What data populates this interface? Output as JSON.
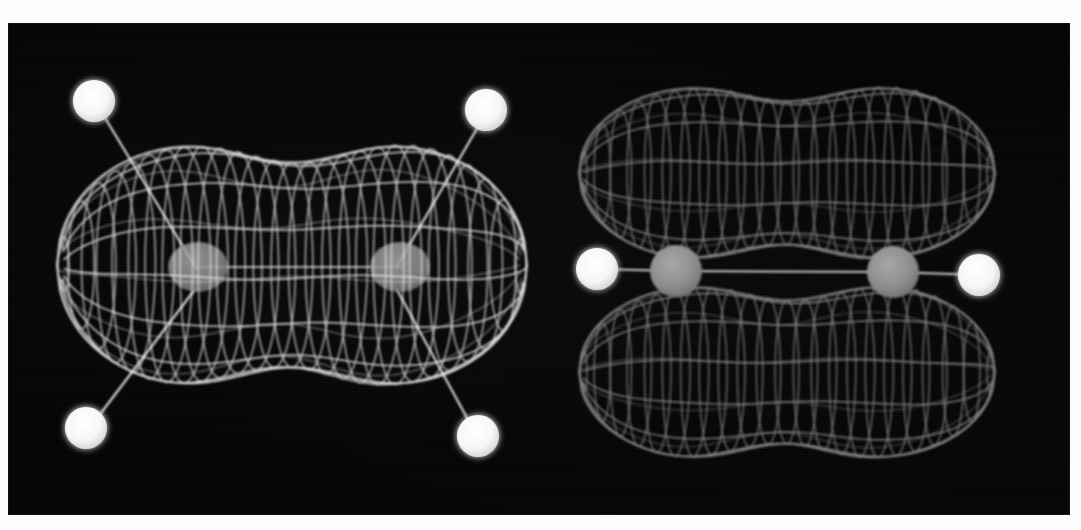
{
  "figure": {
    "background_color": "#fcfcfc",
    "panel_color": "#050505",
    "panel": {
      "x": 8,
      "y": 23,
      "width": 1062,
      "height": 492
    },
    "mesh_color_left": "#f2f2f2",
    "mesh_color_right": "#8e8e8e",
    "hydrogen_color": "#fafafa",
    "carbon_color": "#8a8a8a",
    "bond_color": "#d8d8d8"
  },
  "panels": [
    {
      "id": "sigma-orbital",
      "name": "sigma-bonding-orbital",
      "orbital_type": "sigma",
      "view": "in-plane",
      "lobe_count": 1,
      "mesh_brightness": "bright",
      "envelope": {
        "center_x": 292,
        "center_y": 265,
        "half_width": 235,
        "half_height": 128,
        "waist_ratio": 0.8,
        "u_lines": 26,
        "v_lines": 13
      },
      "atoms": [
        {
          "element": "C",
          "label": "C1",
          "x": 196,
          "y": 265,
          "r": 26,
          "hidden_behind_mesh": true
        },
        {
          "element": "C",
          "label": "C2",
          "x": 396,
          "y": 265,
          "r": 26,
          "hidden_behind_mesh": true
        },
        {
          "element": "H",
          "label": "H1",
          "x": 93,
          "y": 101,
          "r": 21
        },
        {
          "element": "H",
          "label": "H2",
          "x": 486,
          "y": 110,
          "r": 21
        },
        {
          "element": "H",
          "label": "H3",
          "x": 85,
          "y": 428,
          "r": 21
        },
        {
          "element": "H",
          "label": "H4",
          "x": 478,
          "y": 436,
          "r": 21
        }
      ],
      "bonds": [
        {
          "from": "C1",
          "to": "H1"
        },
        {
          "from": "C2",
          "to": "H2"
        },
        {
          "from": "C1",
          "to": "H3"
        },
        {
          "from": "C2",
          "to": "H4"
        },
        {
          "from": "C1",
          "to": "C2"
        }
      ]
    },
    {
      "id": "pi-orbital",
      "name": "pi-bonding-orbital",
      "orbital_type": "pi",
      "view": "edge-on",
      "lobe_count": 2,
      "mesh_brightness": "dim",
      "nodal_plane_y": 270,
      "lobes": [
        {
          "position": "upper",
          "center_x": 787,
          "center_y": 173,
          "half_width": 208,
          "half_height": 92,
          "waist_ratio": 0.78
        },
        {
          "position": "lower",
          "center_x": 787,
          "center_y": 372,
          "half_width": 208,
          "half_height": 92,
          "waist_ratio": 0.78
        }
      ],
      "envelope": {
        "u_lines": 22,
        "v_lines": 11
      },
      "atoms": [
        {
          "element": "C",
          "label": "C1",
          "x": 676,
          "y": 270,
          "r": 25
        },
        {
          "element": "C",
          "label": "C2",
          "x": 893,
          "y": 271,
          "r": 25
        },
        {
          "element": "H",
          "label": "H1",
          "x": 597,
          "y": 268,
          "r": 21
        },
        {
          "element": "H",
          "label": "H2",
          "x": 979,
          "y": 274,
          "r": 21
        }
      ],
      "bonds": [
        {
          "from": "H1",
          "to": "C1"
        },
        {
          "from": "C1",
          "to": "C2"
        },
        {
          "from": "C2",
          "to": "H2"
        }
      ]
    }
  ]
}
